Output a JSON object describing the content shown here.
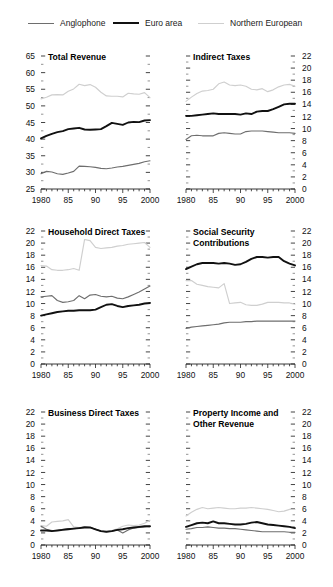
{
  "top_caption": "",
  "legend": {
    "position": "top",
    "items": [
      {
        "label": "Anglophone",
        "color": "#6e6e6e",
        "width": 1.6,
        "icon": "line-swatch-icon"
      },
      {
        "label": "Euro area",
        "color": "#111111",
        "width": 2.6,
        "icon": "line-swatch-icon"
      },
      {
        "label": "Northern European",
        "color": "#cfcfcf",
        "width": 1.6,
        "icon": "line-swatch-icon"
      }
    ]
  },
  "xaxis": {
    "ticklabels": [
      "1980",
      "85",
      "90",
      "95",
      "2000"
    ],
    "tickvalues": [
      1980,
      1985,
      1990,
      1995,
      2000
    ],
    "range": [
      1980,
      2000
    ],
    "minor_step": 1
  },
  "chart_data": [
    {
      "type": "line",
      "title": "Total Revenue",
      "panel": 1,
      "axis_side": "left",
      "xlabel": "",
      "ylabel": "",
      "ylim": [
        25,
        65
      ],
      "ytick_step": 5,
      "yticklabels": [
        "25",
        "30",
        "35",
        "40",
        "45",
        "50",
        "55",
        "60",
        "65"
      ],
      "grid": false,
      "x": [
        1980,
        1981,
        1982,
        1983,
        1984,
        1985,
        1986,
        1987,
        1988,
        1989,
        1990,
        1991,
        1992,
        1993,
        1994,
        1995,
        1996,
        1997,
        1998,
        1999,
        2000
      ],
      "series": [
        {
          "name": "Anglophone",
          "color": "#6e6e6e",
          "values": [
            29.6,
            30.3,
            30.1,
            29.6,
            29.4,
            29.8,
            30.3,
            31.9,
            31.8,
            31.7,
            31.5,
            31.2,
            31.1,
            31.3,
            31.6,
            31.8,
            32.1,
            32.4,
            32.7,
            33.2,
            33.5
          ]
        },
        {
          "name": "Euro area",
          "color": "#111111",
          "values": [
            40.2,
            41.0,
            41.6,
            42.1,
            42.4,
            43.0,
            43.2,
            43.4,
            42.9,
            42.8,
            42.9,
            43.0,
            43.9,
            44.9,
            44.6,
            44.3,
            45.0,
            45.2,
            45.1,
            45.6,
            45.7
          ]
        },
        {
          "name": "Northern European",
          "color": "#cfcfcf",
          "values": [
            52.1,
            52.6,
            53.3,
            53.4,
            53.3,
            54.4,
            55.1,
            56.5,
            56.1,
            56.4,
            55.6,
            54.1,
            53.0,
            52.9,
            52.9,
            52.7,
            53.8,
            53.6,
            53.5,
            54.0,
            52.5
          ]
        }
      ]
    },
    {
      "type": "line",
      "title": "Indirect Taxes",
      "panel": 2,
      "axis_side": "right",
      "xlabel": "",
      "ylabel": "",
      "ylim": [
        0,
        22
      ],
      "ytick_step": 2,
      "yticklabels": [
        "0",
        "2",
        "4",
        "6",
        "8",
        "10",
        "12",
        "14",
        "16",
        "18",
        "20",
        "22"
      ],
      "grid": false,
      "x": [
        1980,
        1981,
        1982,
        1983,
        1984,
        1985,
        1986,
        1987,
        1988,
        1989,
        1990,
        1991,
        1992,
        1993,
        1994,
        1995,
        1996,
        1997,
        1998,
        1999,
        2000
      ],
      "series": [
        {
          "name": "Anglophone",
          "color": "#6e6e6e",
          "values": [
            8.2,
            8.8,
            8.9,
            8.8,
            8.8,
            8.8,
            9.2,
            9.3,
            9.2,
            9.1,
            9.1,
            9.5,
            9.6,
            9.6,
            9.6,
            9.5,
            9.4,
            9.3,
            9.3,
            9.3,
            9.2
          ]
        },
        {
          "name": "Euro area",
          "color": "#111111",
          "values": [
            12.1,
            12.1,
            12.2,
            12.3,
            12.4,
            12.5,
            12.4,
            12.4,
            12.4,
            12.4,
            12.3,
            12.5,
            12.4,
            12.8,
            12.9,
            12.9,
            13.2,
            13.6,
            14.0,
            14.1,
            14.1
          ]
        },
        {
          "name": "Northern European",
          "color": "#cfcfcf",
          "values": [
            14.5,
            15.2,
            15.8,
            16.2,
            16.3,
            16.5,
            17.4,
            17.7,
            17.2,
            17.1,
            17.2,
            17.0,
            16.5,
            16.4,
            16.6,
            16.1,
            16.4,
            16.9,
            17.2,
            17.3,
            17.0
          ]
        }
      ]
    },
    {
      "type": "line",
      "title": "Household Direct Taxes",
      "panel": 3,
      "axis_side": "left",
      "xlabel": "",
      "ylabel": "",
      "ylim": [
        0,
        22
      ],
      "ytick_step": 2,
      "yticklabels": [
        "0",
        "2",
        "4",
        "6",
        "8",
        "10",
        "12",
        "14",
        "16",
        "18",
        "20",
        "22"
      ],
      "grid": false,
      "x": [
        1980,
        1981,
        1982,
        1983,
        1984,
        1985,
        1986,
        1987,
        1988,
        1989,
        1990,
        1991,
        1992,
        1993,
        1994,
        1995,
        1996,
        1997,
        1998,
        1999,
        2000
      ],
      "series": [
        {
          "name": "Anglophone",
          "color": "#6e6e6e",
          "values": [
            11.1,
            11.2,
            11.3,
            10.5,
            10.2,
            10.3,
            10.5,
            11.3,
            10.8,
            11.4,
            11.5,
            11.2,
            11.1,
            11.2,
            10.9,
            10.8,
            11.1,
            11.5,
            11.9,
            12.4,
            12.9
          ]
        },
        {
          "name": "Euro area",
          "color": "#111111",
          "values": [
            8.0,
            8.2,
            8.4,
            8.6,
            8.7,
            8.8,
            8.8,
            8.9,
            8.9,
            8.9,
            9.0,
            9.4,
            9.8,
            9.9,
            9.6,
            9.4,
            9.6,
            9.7,
            9.8,
            10.0,
            10.1
          ]
        },
        {
          "name": "Northern European",
          "color": "#cfcfcf",
          "values": [
            16.3,
            16.2,
            15.6,
            15.5,
            15.5,
            15.6,
            15.8,
            15.5,
            20.6,
            20.4,
            19.3,
            19.1,
            19.2,
            19.3,
            19.5,
            19.6,
            19.8,
            19.9,
            20.0,
            20.1,
            19.3
          ]
        }
      ]
    },
    {
      "type": "line",
      "title": "Social Security Contributions",
      "title_lines": [
        "Social Security",
        "Contributions"
      ],
      "panel": 4,
      "axis_side": "right",
      "xlabel": "",
      "ylabel": "",
      "ylim": [
        0,
        22
      ],
      "ytick_step": 2,
      "yticklabels": [
        "0",
        "2",
        "4",
        "6",
        "8",
        "10",
        "12",
        "14",
        "16",
        "18",
        "20",
        "22"
      ],
      "grid": false,
      "x": [
        1980,
        1981,
        1982,
        1983,
        1984,
        1985,
        1986,
        1987,
        1988,
        1989,
        1990,
        1991,
        1992,
        1993,
        1994,
        1995,
        1996,
        1997,
        1998,
        1999,
        2000
      ],
      "series": [
        {
          "name": "Anglophone",
          "color": "#6e6e6e",
          "values": [
            5.9,
            6.1,
            6.2,
            6.3,
            6.4,
            6.5,
            6.6,
            6.8,
            6.9,
            6.9,
            6.9,
            7.0,
            7.0,
            7.1,
            7.1,
            7.1,
            7.1,
            7.1,
            7.1,
            7.1,
            7.1
          ]
        },
        {
          "name": "Euro area",
          "color": "#111111",
          "values": [
            15.7,
            16.1,
            16.5,
            16.7,
            16.7,
            16.7,
            16.6,
            16.7,
            16.6,
            16.4,
            16.5,
            16.9,
            17.4,
            17.7,
            17.7,
            17.6,
            17.7,
            17.7,
            17.0,
            16.6,
            16.3
          ]
        },
        {
          "name": "Northern European",
          "color": "#cfcfcf",
          "values": [
            13.8,
            13.8,
            13.2,
            13.0,
            12.8,
            12.7,
            12.6,
            13.3,
            10.0,
            10.1,
            10.2,
            9.8,
            9.7,
            9.7,
            9.9,
            10.2,
            10.2,
            10.2,
            10.1,
            10.1,
            9.9
          ]
        }
      ]
    },
    {
      "type": "line",
      "title": "Business Direct Taxes",
      "panel": 5,
      "axis_side": "left",
      "xlabel": "",
      "ylabel": "",
      "ylim": [
        0,
        22
      ],
      "ytick_step": 2,
      "yticklabels": [
        "0",
        "2",
        "4",
        "6",
        "8",
        "10",
        "12",
        "14",
        "16",
        "18",
        "20",
        "22"
      ],
      "grid": false,
      "x": [
        1980,
        1981,
        1982,
        1983,
        1984,
        1985,
        1986,
        1987,
        1988,
        1989,
        1990,
        1991,
        1992,
        1993,
        1994,
        1995,
        1996,
        1997,
        1998,
        1999,
        2000
      ],
      "series": [
        {
          "name": "Anglophone",
          "color": "#6e6e6e",
          "values": [
            3.1,
            2.6,
            2.4,
            2.4,
            2.6,
            2.7,
            2.7,
            2.8,
            3.0,
            2.9,
            2.6,
            2.3,
            2.2,
            2.3,
            2.5,
            2.0,
            2.5,
            2.8,
            2.9,
            3.0,
            3.1
          ]
        },
        {
          "name": "Euro area",
          "color": "#111111",
          "values": [
            2.4,
            2.4,
            2.3,
            2.4,
            2.5,
            2.6,
            2.7,
            2.8,
            2.9,
            2.9,
            2.6,
            2.3,
            2.2,
            2.3,
            2.5,
            2.6,
            2.8,
            2.9,
            3.0,
            3.1,
            3.1
          ]
        },
        {
          "name": "Northern European",
          "color": "#cfcfcf",
          "values": [
            3.2,
            3.1,
            3.8,
            3.9,
            4.0,
            4.2,
            3.0,
            2.9,
            3.0,
            2.9,
            2.6,
            2.3,
            2.2,
            2.4,
            2.7,
            3.1,
            3.3,
            3.2,
            3.3,
            3.6,
            4.1
          ]
        }
      ]
    },
    {
      "type": "line",
      "title": "Property Income and Other Revenue",
      "title_lines": [
        "Property Income and",
        "Other Revenue"
      ],
      "panel": 6,
      "axis_side": "right",
      "xlabel": "",
      "ylabel": "",
      "ylim": [
        0,
        22
      ],
      "ytick_step": 2,
      "yticklabels": [
        "0",
        "2",
        "4",
        "6",
        "8",
        "10",
        "12",
        "14",
        "16",
        "18",
        "20",
        "22"
      ],
      "grid": false,
      "x": [
        1980,
        1981,
        1982,
        1983,
        1984,
        1985,
        1986,
        1987,
        1988,
        1989,
        1990,
        1991,
        1992,
        1993,
        1994,
        1995,
        1996,
        1997,
        1998,
        1999,
        2000
      ],
      "series": [
        {
          "name": "Anglophone",
          "color": "#6e6e6e",
          "values": [
            2.6,
            2.7,
            2.9,
            2.9,
            3.0,
            2.9,
            2.8,
            2.8,
            2.7,
            2.7,
            2.6,
            2.5,
            2.4,
            2.3,
            2.2,
            2.2,
            2.2,
            2.2,
            2.2,
            2.1,
            2.1
          ]
        },
        {
          "name": "Euro area",
          "color": "#111111",
          "values": [
            3.0,
            3.3,
            3.6,
            3.7,
            3.6,
            3.9,
            3.6,
            3.6,
            3.5,
            3.4,
            3.4,
            3.5,
            3.7,
            3.8,
            3.6,
            3.4,
            3.3,
            3.2,
            3.1,
            3.0,
            2.8
          ]
        },
        {
          "name": "Northern European",
          "color": "#cfcfcf",
          "values": [
            4.8,
            5.4,
            5.9,
            6.2,
            6.0,
            6.1,
            6.2,
            6.1,
            6.0,
            6.0,
            6.1,
            6.1,
            6.2,
            6.1,
            6.0,
            5.9,
            5.7,
            5.5,
            5.6,
            5.9,
            5.9
          ]
        }
      ]
    }
  ]
}
